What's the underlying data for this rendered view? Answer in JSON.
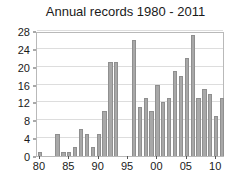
{
  "chart_data": {
    "type": "bar",
    "title": "Annual records 1980 - 2011",
    "xlabel": "",
    "ylabel": "",
    "categories": [
      "80",
      "81",
      "82",
      "83",
      "84",
      "85",
      "86",
      "87",
      "88",
      "89",
      "90",
      "91",
      "92",
      "93",
      "94",
      "95",
      "96",
      "97",
      "98",
      "99",
      "00",
      "01",
      "02",
      "03",
      "04",
      "05",
      "06",
      "07",
      "08",
      "09",
      "10",
      "11"
    ],
    "values": [
      1,
      0,
      0,
      5,
      1,
      1,
      2,
      6,
      5,
      2,
      5,
      10,
      21,
      21,
      0,
      0,
      26,
      11,
      13,
      10,
      16,
      12,
      13,
      19,
      18,
      22,
      27,
      13,
      15,
      14,
      9,
      13
    ],
    "ylim": [
      0,
      28
    ],
    "yticks": [
      0,
      4,
      8,
      12,
      16,
      20,
      24,
      28
    ],
    "ytick_labels": [
      "0",
      "4",
      "8",
      "12",
      "16",
      "20",
      "24",
      "28"
    ],
    "xticks": [
      "80",
      "85",
      "90",
      "95",
      "00",
      "05",
      "10"
    ],
    "xtick_labels": [
      "80",
      "85",
      "90",
      "95",
      "00",
      "05",
      "10"
    ],
    "xtick_indices": [
      0,
      5,
      10,
      15,
      20,
      25,
      30
    ],
    "grid": "horizontal",
    "legend": "none",
    "bar_color": "#a8a8a8",
    "bar_edge_color": "#8f8f8f",
    "grid_color": "#dddddd",
    "axis_color": "#b9b9b9",
    "text_color": "#1a1a1a",
    "background_color": "#ffffff"
  }
}
